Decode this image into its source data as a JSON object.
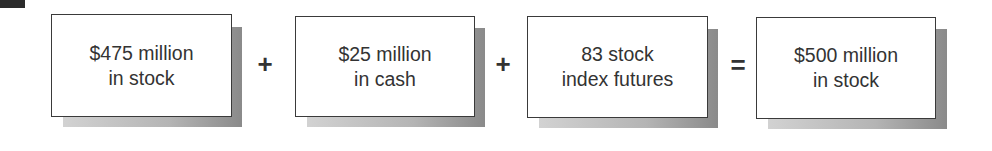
{
  "diagram": {
    "boxes": [
      {
        "line1": "$475 million",
        "line2": "in stock"
      },
      {
        "line1": "$25 million",
        "line2": "in cash"
      },
      {
        "line1": "83 stock",
        "line2": "index futures"
      },
      {
        "line1": "$500 million",
        "line2": "in stock"
      }
    ],
    "operators": [
      "+",
      "+",
      "="
    ]
  },
  "colors": {
    "border": "#3a3a3a",
    "text": "#333333",
    "shadow_light": "#d2d2d2",
    "shadow_dark": "#8a8a8a"
  }
}
